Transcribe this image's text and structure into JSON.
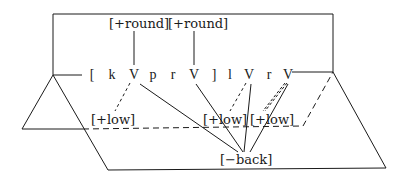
{
  "diagram": {
    "type": "autosegmental-phonology",
    "colors": {
      "stroke": "#1a1a1a",
      "background": "#ffffff"
    },
    "skeleton": {
      "open_bracket": "[",
      "segments": [
        "k",
        "V",
        "p",
        "r",
        "V",
        "]",
        "l",
        "V",
        "r",
        "V"
      ]
    },
    "upper_tier": {
      "features": [
        "[+round]",
        "[+round]"
      ],
      "links": [
        "V1",
        "V2"
      ]
    },
    "middle_tier": {
      "features": [
        "[+low]",
        "[+low]",
        "[+low]"
      ],
      "links_dashed": [
        "V1",
        "V3",
        "V4"
      ]
    },
    "lower_tier": {
      "feature": "[−back]",
      "links": [
        "V1",
        "V2",
        "V3",
        "V4"
      ]
    }
  }
}
